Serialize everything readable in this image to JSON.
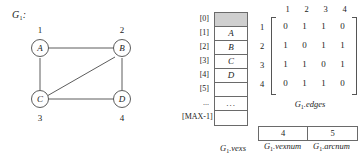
{
  "figure": {
    "graph": {
      "title": "G",
      "title_sub": "1",
      "title_colon": ":",
      "nodes": [
        {
          "label": "A",
          "index": "1"
        },
        {
          "label": "B",
          "index": "2"
        },
        {
          "label": "C",
          "index": "3"
        },
        {
          "label": "D",
          "index": "4"
        }
      ],
      "edges": [
        "A-B",
        "A-C",
        "B-C",
        "B-D",
        "C-D"
      ]
    },
    "vexs_array": {
      "indices": [
        "[0]",
        "[1]",
        "[2]",
        "[3]",
        "[4]",
        "[5]",
        "...",
        "[MAX-1]"
      ],
      "cells": [
        "",
        "A",
        "B",
        "C",
        "D",
        "",
        "...",
        ""
      ],
      "shaded_cell_index": 0,
      "caption": "G",
      "caption_sub": "1",
      "caption_rest": ".vexs"
    },
    "matrix": {
      "col_headers": [
        "1",
        "2",
        "3",
        "4"
      ],
      "row_headers": [
        "1",
        "2",
        "3",
        "4"
      ],
      "rows": [
        [
          "0",
          "1",
          "1",
          "0"
        ],
        [
          "1",
          "0",
          "1",
          "1"
        ],
        [
          "1",
          "1",
          "0",
          "1"
        ],
        [
          "0",
          "1",
          "1",
          "0"
        ]
      ],
      "caption": "G",
      "caption_sub": "1",
      "caption_rest": ".edges"
    },
    "counters": [
      {
        "value": "4",
        "caption": "G",
        "caption_sub": "1",
        "caption_rest": ".vexnum"
      },
      {
        "value": "5",
        "caption": "G",
        "caption_sub": "1",
        "caption_rest": ".arcnum"
      }
    ]
  },
  "colors": {
    "stroke": "#4a4a4a",
    "shaded_cell": "#cfcfcf",
    "text": "#1b1b1b",
    "background": "#ffffff"
  }
}
